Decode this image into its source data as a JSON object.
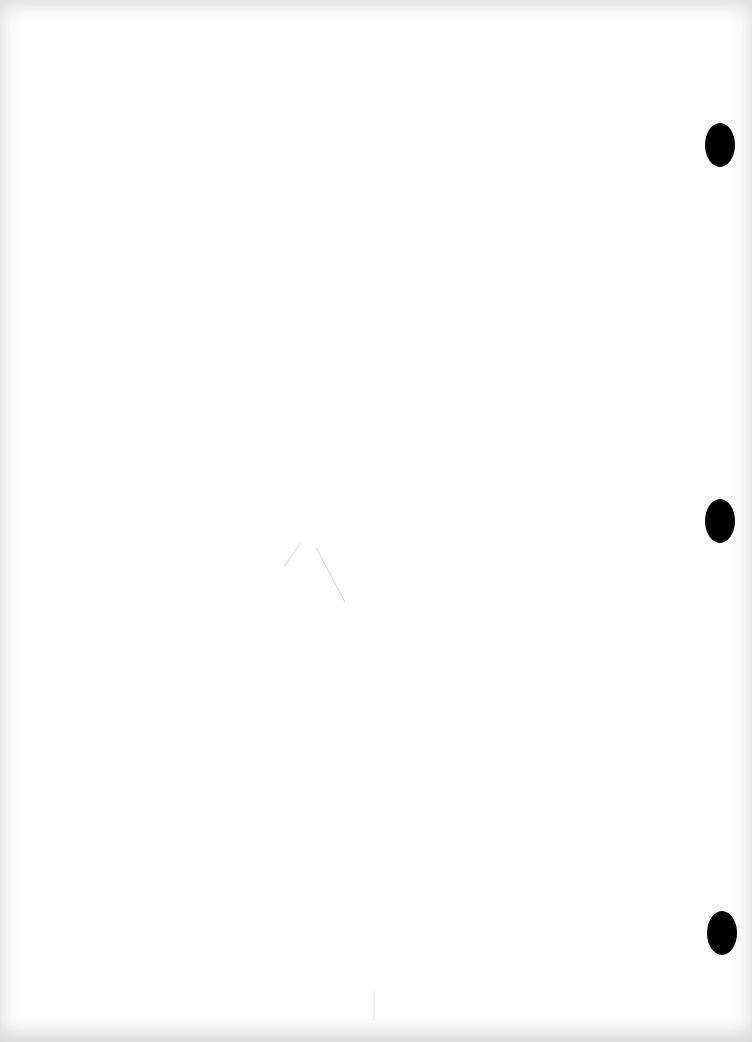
{
  "document": {
    "description": "Blank scanned sheet of paper",
    "text": "",
    "punch_holes": [
      {
        "label": "top-hole",
        "x": 705,
        "y": 123
      },
      {
        "label": "middle-hole",
        "x": 705,
        "y": 499
      },
      {
        "label": "bottom-hole",
        "x": 707,
        "y": 911
      }
    ],
    "colors": {
      "paper": "#fefefe",
      "hole": "#000000",
      "faint_mark": "#d8d8d8"
    }
  }
}
